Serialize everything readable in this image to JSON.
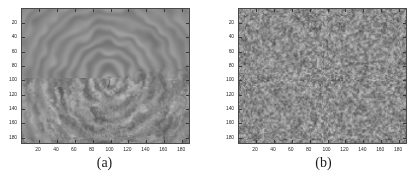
{
  "figure": {
    "background": "#ffffff",
    "width": 418,
    "height": 181
  },
  "chart_data": [
    {
      "type": "heatmap",
      "panel": "a",
      "caption": "(a)",
      "title": "",
      "xlabel": "",
      "ylabel": "",
      "xlim": [
        1,
        190
      ],
      "ylim": [
        1,
        190
      ],
      "xticks": [
        20,
        40,
        60,
        80,
        100,
        120,
        140,
        160,
        180
      ],
      "yticks": [
        20,
        40,
        60,
        80,
        100,
        120,
        140,
        160,
        180
      ],
      "xticklabels": [
        "20",
        "40",
        "60",
        "80",
        "100",
        "120",
        "140",
        "160",
        "180"
      ],
      "yticklabels": [
        "20",
        "40",
        "60",
        "80",
        "100",
        "120",
        "140",
        "160",
        "180"
      ],
      "y_axis_direction": "reversed",
      "grid": false,
      "legend": false,
      "colormap": "gray",
      "value_range": [
        0,
        255
      ],
      "mean_level": 138,
      "description": "Grayscale speckle texture with concentric swirl / vortex pattern centred near (100, 100)",
      "pattern": "concentric-swirl",
      "pattern_center": [
        100,
        98
      ],
      "texture_scale": 3.2,
      "contrast": 0.34
    },
    {
      "type": "heatmap",
      "panel": "b",
      "caption": "(b)",
      "title": "",
      "xlabel": "",
      "ylabel": "",
      "xlim": [
        1,
        190
      ],
      "ylim": [
        1,
        190
      ],
      "xticks": [
        20,
        40,
        60,
        80,
        100,
        120,
        140,
        160,
        180
      ],
      "yticks": [
        20,
        40,
        60,
        80,
        100,
        120,
        140,
        160,
        180
      ],
      "xticklabels": [
        "20",
        "40",
        "60",
        "80",
        "100",
        "120",
        "140",
        "160",
        "180"
      ],
      "yticklabels": [
        "20",
        "40",
        "60",
        "80",
        "100",
        "120",
        "140",
        "160",
        "180"
      ],
      "y_axis_direction": "reversed",
      "grid": false,
      "legend": false,
      "colormap": "gray",
      "value_range": [
        0,
        255
      ],
      "mean_level": 140,
      "description": "Grayscale fine-grained isotropic random noise texture, no directional structure",
      "pattern": "isotropic-noise",
      "pattern_center": null,
      "texture_scale": 1.5,
      "contrast": 0.3
    }
  ],
  "panels": [
    {
      "id": "a",
      "caption": "(a)",
      "xticklabels": [
        "20",
        "40",
        "60",
        "80",
        "100",
        "120",
        "140",
        "160",
        "180"
      ],
      "yticklabels": [
        "20",
        "40",
        "60",
        "80",
        "100",
        "120",
        "140",
        "160",
        "180"
      ]
    },
    {
      "id": "b",
      "caption": "(b)",
      "xticklabels": [
        "20",
        "40",
        "60",
        "80",
        "100",
        "120",
        "140",
        "160",
        "180"
      ],
      "yticklabels": [
        "20",
        "40",
        "60",
        "80",
        "100",
        "120",
        "140",
        "160",
        "180"
      ]
    }
  ],
  "colors": {
    "background": "#ffffff",
    "axis_line": "#4a4a4a",
    "tick_label": "#2b2b2b",
    "caption": "#1c1c1c",
    "image_mean_gray": "#8a8a8a"
  }
}
